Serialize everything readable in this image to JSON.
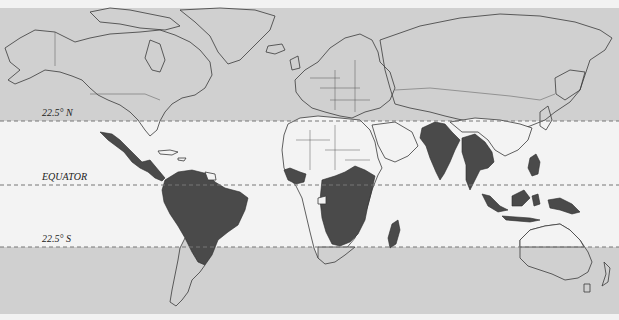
{
  "map": {
    "title": "Tropical regions world map",
    "labels": {
      "north": "22.5° N",
      "equator": "EQUATOR",
      "south": "22.5° S"
    },
    "latitude_lines": [
      {
        "name": "22.5° N",
        "y": 121
      },
      {
        "name": "Equator",
        "y": 185
      },
      {
        "name": "22.5° S",
        "y": 247
      }
    ],
    "colors": {
      "polar_band": "#d0d0d0",
      "tropical_band": "#f3f3f3",
      "shaded_regions": "#4a4a4a",
      "outline": "#3a3a3a"
    },
    "shaded_regions": [
      "Mexico",
      "Central America",
      "Northern South America",
      "Brazil",
      "West Africa (Gulf of Guinea)",
      "Central Africa",
      "East Africa",
      "Madagascar",
      "India",
      "Southeast Asia",
      "Philippines",
      "Indonesia",
      "Papua New Guinea"
    ]
  }
}
